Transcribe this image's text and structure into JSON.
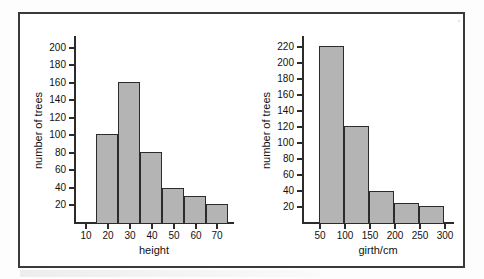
{
  "figure": {
    "background_color": "#ffffff",
    "frame_color": "#3a3a3a",
    "bar_fill_color": "#b4b4b4",
    "bar_edge_color": "#2b2b2b"
  },
  "chart_data": [
    {
      "type": "bar",
      "id": "tree-height-histogram",
      "title": "",
      "xlabel": "height",
      "ylabel": "number of trees",
      "categories": [
        "15-25",
        "25-35",
        "35-45",
        "45-55",
        "55-65",
        "65-75"
      ],
      "bin_edges": [
        15,
        25,
        35,
        45,
        55,
        65,
        75
      ],
      "values": [
        100,
        160,
        80,
        39,
        30,
        20
      ],
      "xticks": [
        10,
        20,
        30,
        40,
        50,
        60,
        70
      ],
      "xtick_labels": [
        "10",
        "20",
        "30",
        "40",
        "50",
        "60",
        "70"
      ],
      "yticks": [
        20,
        40,
        60,
        80,
        100,
        120,
        140,
        160,
        180,
        200
      ],
      "ytick_labels": [
        "20",
        "40",
        "60",
        "80",
        "100",
        "120",
        "140",
        "160",
        "180",
        "200"
      ],
      "xlim": [
        5,
        78
      ],
      "ylim": [
        0,
        212
      ],
      "grid": false,
      "legend": false
    },
    {
      "type": "bar",
      "id": "tree-girth-histogram",
      "title": "",
      "xlabel": "girth/cm",
      "ylabel": "number of trees",
      "categories": [
        "50-100",
        "100-150",
        "150-200",
        "200-250",
        "250-300"
      ],
      "bin_edges": [
        50,
        100,
        150,
        200,
        250,
        300
      ],
      "values": [
        220,
        120,
        39,
        24,
        20
      ],
      "xticks": [
        50,
        100,
        150,
        200,
        250,
        300
      ],
      "xtick_labels": [
        "50",
        "100",
        "150",
        "200",
        "250",
        "300"
      ],
      "yticks": [
        20,
        40,
        60,
        80,
        100,
        120,
        140,
        160,
        180,
        200,
        220
      ],
      "ytick_labels": [
        "20",
        "40",
        "60",
        "80",
        "100",
        "120",
        "140",
        "160",
        "180",
        "200",
        "220"
      ],
      "xlim": [
        15,
        320
      ],
      "ylim": [
        0,
        232
      ],
      "grid": false,
      "legend": false
    }
  ]
}
